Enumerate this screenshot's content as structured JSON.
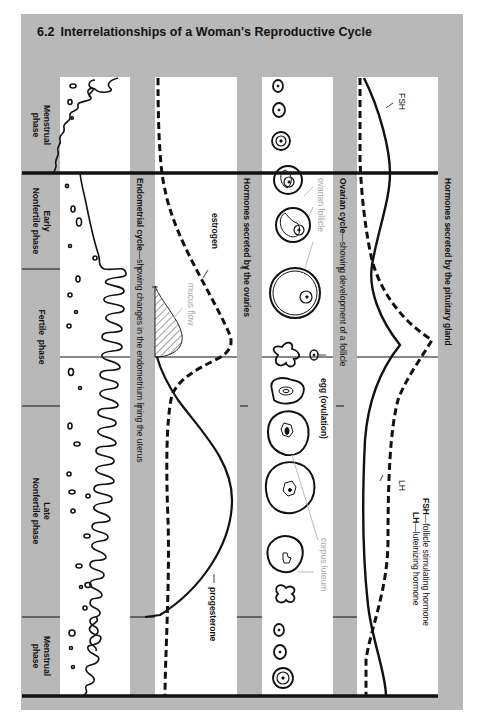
{
  "figure": {
    "number": "6.2",
    "title": "Interrelationships of a Woman's Reproductive Cycle"
  },
  "phases": [
    {
      "label_line1": "Menstrual",
      "label_line2": "phase"
    },
    {
      "label_line1": "Early",
      "label_line2": "Nonfertile phase"
    },
    {
      "label_line1": "Fertile  phase",
      "label_line2": ""
    },
    {
      "label_line1": "Late",
      "label_line2": "Nonfertile phase"
    },
    {
      "label_line1": "Menstrual",
      "label_line2": "phase"
    }
  ],
  "panels": {
    "endometrial": {
      "heading_bold": "Endometrial cycle",
      "heading_rest": "—showing changes in the endometrium lining the uterus",
      "annotation_mucus": "mucus flow"
    },
    "ovarian_hormones": {
      "heading": "Hormones secreted by the ovaries",
      "label_estrogen": "estrogen",
      "label_progesterone": "progesterone"
    },
    "ovarian_cycle": {
      "heading_bold": "Ovarian cycle",
      "heading_rest": "—showing development of a follicle",
      "label_follicle": "ovarian follicle",
      "label_egg": "egg (ovulation)",
      "label_corpus": "corpus luteum"
    },
    "pituitary": {
      "heading": "Hormones secreted by the pituitary gland",
      "label_fsh": "FSH",
      "label_lh": "LH",
      "legend_fsh_abbr": "FSH",
      "legend_fsh_text": "—follicle stimulating hormone",
      "legend_lh_abbr": "LH",
      "legend_lh_text": "—luteinizing hormone"
    }
  },
  "colors": {
    "panel_gray": "#b8b8b8",
    "strip_white": "#ffffff",
    "ink": "#111111",
    "annotation_gray": "#a8a8a8"
  }
}
